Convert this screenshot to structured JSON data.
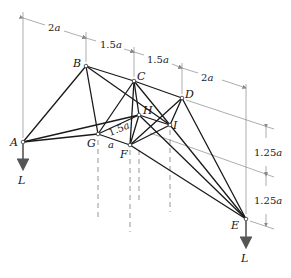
{
  "diagram": {
    "type": "space-truss",
    "joints": {
      "A": {
        "label": "A",
        "x": 23,
        "y": 142
      },
      "B": {
        "label": "B",
        "x": 86,
        "y": 66
      },
      "C": {
        "label": "C",
        "x": 134,
        "y": 81
      },
      "D": {
        "label": "D",
        "x": 182,
        "y": 98
      },
      "E": {
        "label": "E",
        "x": 246,
        "y": 219
      },
      "F": {
        "label": "F",
        "x": 130,
        "y": 145
      },
      "G": {
        "label": "G",
        "x": 98,
        "y": 134
      },
      "H": {
        "label": "H",
        "x": 139,
        "y": 115
      },
      "I": {
        "label": "I",
        "x": 170,
        "y": 125
      }
    },
    "members": [
      [
        "A",
        "B"
      ],
      [
        "A",
        "G"
      ],
      [
        "A",
        "H"
      ],
      [
        "B",
        "C"
      ],
      [
        "B",
        "G"
      ],
      [
        "B",
        "I"
      ],
      [
        "C",
        "D"
      ],
      [
        "C",
        "G"
      ],
      [
        "C",
        "F"
      ],
      [
        "C",
        "H"
      ],
      [
        "C",
        "I"
      ],
      [
        "D",
        "I"
      ],
      [
        "D",
        "F"
      ],
      [
        "D",
        "E"
      ],
      [
        "G",
        "H"
      ],
      [
        "G",
        "F"
      ],
      [
        "H",
        "F"
      ],
      [
        "H",
        "I"
      ],
      [
        "H",
        "E"
      ],
      [
        "I",
        "F"
      ],
      [
        "I",
        "E"
      ],
      [
        "F",
        "E"
      ]
    ],
    "loads": [
      {
        "joint": "A",
        "label": "L",
        "direction": "down"
      },
      {
        "joint": "E",
        "label": "L",
        "direction": "down"
      }
    ],
    "top_dimensions": [
      {
        "from": "A",
        "to": "B",
        "label": "2a"
      },
      {
        "from": "B",
        "to": "C",
        "label": "1.5a"
      },
      {
        "from": "C",
        "to": "D",
        "label": "1.5a"
      },
      {
        "from": "D",
        "to": "E",
        "label": "2a"
      }
    ],
    "side_dimensions": [
      {
        "label": "1.25a"
      },
      {
        "label": "1.25a"
      }
    ],
    "inner_dimensions": [
      {
        "between": [
          "G",
          "H"
        ],
        "label": "1.5a"
      },
      {
        "between": [
          "G",
          "F"
        ],
        "label": "a"
      }
    ]
  },
  "labels": {
    "A": "A",
    "B": "B",
    "C": "C",
    "D": "D",
    "E": "E",
    "F": "F",
    "G": "G",
    "H": "H",
    "I": "I",
    "load_A": "L",
    "load_E": "L",
    "dim_AB_num": "2",
    "dim_BC_num": "1.5",
    "dim_CD_num": "1.5",
    "dim_DE_num": "2",
    "dim_side1_num": "1.25",
    "dim_side2_num": "1.25",
    "dim_GH_num": "1.5",
    "dim_GF": "a",
    "unit": "a"
  }
}
